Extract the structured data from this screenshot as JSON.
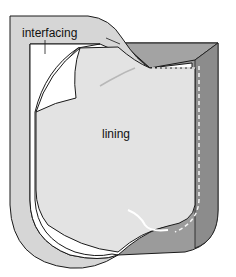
{
  "diagram": {
    "labels": {
      "interfacing": "interfacing",
      "lining": "lining"
    },
    "colors": {
      "outer_facing": "#d8d8d8",
      "lining": "#e2e2e2",
      "interfacing_white": "#ffffff",
      "dark_facing": "#9a9a9a",
      "outline": "#1a1a1a",
      "stitch": "#f4f4f4"
    }
  }
}
